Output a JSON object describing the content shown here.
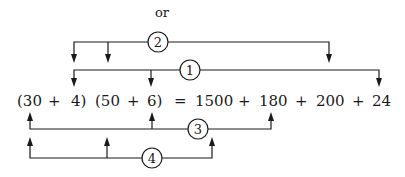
{
  "header": {
    "connector": "or"
  },
  "equation": {
    "tokens": [
      "(30",
      "+",
      "4)",
      "(50",
      "+",
      "6)",
      "=",
      "1500",
      "+",
      "180",
      "+",
      "200",
      "+",
      "24"
    ]
  },
  "brackets": [
    {
      "label": "2",
      "position": "above",
      "connects": [
        "30",
        "4",
        "200"
      ]
    },
    {
      "label": "1",
      "position": "above",
      "connects": [
        "30",
        "6",
        "24"
      ]
    },
    {
      "label": "3",
      "position": "below",
      "connects": [
        "30",
        "6",
        "180"
      ]
    },
    {
      "label": "4",
      "position": "below",
      "connects": [
        "30",
        "4",
        "1500"
      ]
    }
  ]
}
